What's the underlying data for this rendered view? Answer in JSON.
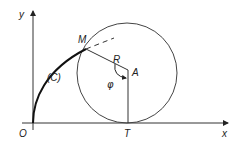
{
  "figure": {
    "type": "geometric construction",
    "axes": {
      "x_label": "x",
      "y_label": "y",
      "origin_label": "O"
    },
    "points": {
      "M": "M",
      "A": "A",
      "T": "T"
    },
    "labels": {
      "curve": "(C)",
      "radius": "R",
      "angle": "φ"
    },
    "colors": {
      "stroke": "#222222",
      "circle": "#444444",
      "background": "#ffffff"
    }
  }
}
